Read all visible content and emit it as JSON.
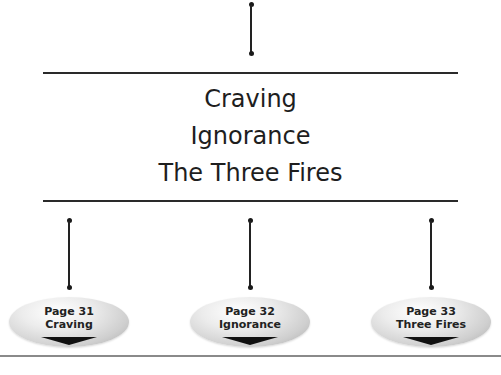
{
  "diagram": {
    "title_lines": [
      "Craving",
      "Ignorance",
      "The Three Fires"
    ],
    "links": [
      {
        "page_label": "Page 31",
        "title": "Craving"
      },
      {
        "page_label": "Page 32",
        "title": "Ignorance"
      },
      {
        "page_label": "Page 33",
        "title": "Three Fires"
      }
    ],
    "colors": {
      "line": "#222222",
      "text": "#1e1e1e",
      "oval_light": "#ffffff",
      "oval_dark": "#a9a9a9",
      "arrow": "#111111",
      "bottom_rule": "#8a8a8a"
    }
  }
}
